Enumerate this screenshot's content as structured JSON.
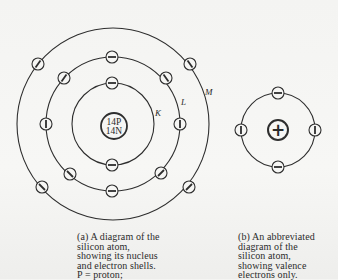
{
  "figure_a": {
    "nucleus": {
      "line1": "14P",
      "line2": "14N"
    },
    "shell_labels": {
      "k": "K",
      "l": "L",
      "m": "M"
    },
    "shells": [
      {
        "name": "K",
        "electrons": 2
      },
      {
        "name": "L",
        "electrons": 8
      },
      {
        "name": "M",
        "electrons": 4
      }
    ],
    "caption": "(a) A diagram of the\nsilicon atom,\nshowing its nucleus\nand electron shells.\nP = proton;"
  },
  "figure_b": {
    "nucleus_symbol": "+",
    "valence_electrons": 4,
    "caption": "(b) An abbreviated\ndiagram of the\nsilicon atom,\nshowing valence\nelectrons only."
  },
  "colors": {
    "line": "#2e2e2e",
    "background": "#f5f5f3"
  }
}
